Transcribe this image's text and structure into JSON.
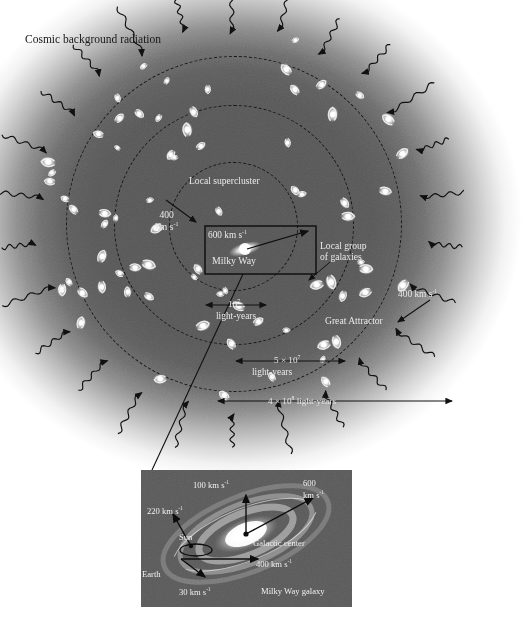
{
  "figure": {
    "title": "Cosmic background radiation",
    "caption_inset": "Milky Way galaxy"
  },
  "cosmic_map": {
    "title_label": "Cosmic background radiation",
    "rings": [
      {
        "name": "local-group",
        "label": "Local group of galaxies"
      },
      {
        "name": "local-supercluster",
        "label": "Local supercluster"
      },
      {
        "name": "great-attractor",
        "label": "Great Attractor"
      }
    ],
    "milky_way_box": {
      "velocity": "600 km s",
      "velocity_exp": "-1",
      "name": "Milky Way"
    },
    "velocity_left": {
      "value": "400",
      "unit": "km s",
      "exp": "-1"
    },
    "velocity_right": {
      "value": "400 km s",
      "exp": "-1"
    },
    "local_group_label_line1": "Local group",
    "local_group_label_line2": "of galaxies",
    "supercluster_label": "Local supercluster",
    "great_attractor_label": "Great Attractor",
    "scales": [
      {
        "name": "local-group-scale",
        "value": "10",
        "exp": "7",
        "unit": "light-years"
      },
      {
        "name": "supercluster-scale",
        "value": "5 × 10",
        "exp": "7",
        "unit": "light-years"
      },
      {
        "name": "great-attractor-scale",
        "value": "4 × 10",
        "exp": "8",
        "unit": "light-years"
      }
    ]
  },
  "inset": {
    "name": "Milky Way galaxy",
    "galactic_center": "Galactic center",
    "sun": "Sun",
    "earth": "Earth",
    "velocities": [
      {
        "name": "rotation-100",
        "text": "100 km s",
        "exp": "-1"
      },
      {
        "name": "bulk-600",
        "line1": "600",
        "line2": "km s",
        "exp": "-1"
      },
      {
        "name": "sun-orbit-220",
        "text": "220 km s",
        "exp": "-1"
      },
      {
        "name": "galaxy-400",
        "text": "400 km s",
        "exp": "-1"
      },
      {
        "name": "earth-orbit-30",
        "text": "30 km s",
        "exp": "-1"
      }
    ]
  },
  "colors": {
    "sphere_core": "#565656",
    "sphere_edge": "#ffffff",
    "inset_bg": "#5a5a5a",
    "ink": "#141414",
    "label_light": "#f0f0f0"
  }
}
